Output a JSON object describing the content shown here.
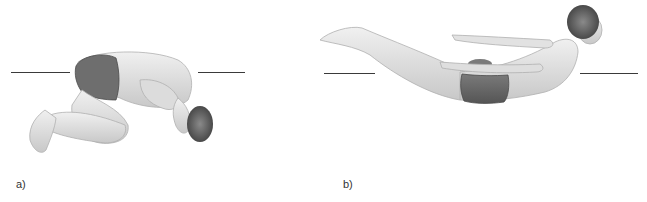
{
  "figure": {
    "panels": [
      {
        "id": "a",
        "label": "a)",
        "description": "Curled fetal / tuck position figure with horizontal reference line",
        "colors": {
          "skin": "#e6e6e6",
          "skin_shadow": "#bdbdbd",
          "trunks": "#6a6a6a",
          "hair": "#555555",
          "line": "#3a3a3a"
        }
      },
      {
        "id": "b",
        "label": "b)",
        "description": "Extended prone 'superman' position figure with horizontal reference line",
        "colors": {
          "skin": "#e6e6e6",
          "skin_shadow": "#bdbdbd",
          "trunks": "#6a6a6a",
          "hair": "#555555",
          "line": "#3a3a3a"
        }
      }
    ]
  }
}
